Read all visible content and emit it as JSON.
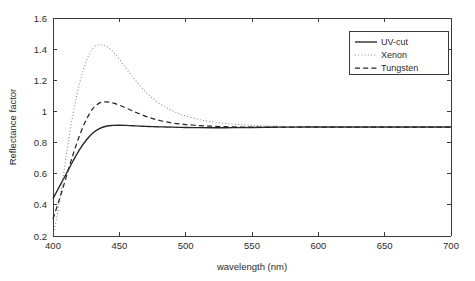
{
  "chart_data": {
    "type": "line",
    "title": "",
    "xlabel": "wavelength (nm)",
    "ylabel": "Reflectance factor",
    "xlim": [
      400,
      700
    ],
    "ylim": [
      0.2,
      1.6
    ],
    "xticks": [
      400,
      450,
      500,
      550,
      600,
      650,
      700
    ],
    "xticklabels": [
      "400",
      "450",
      "500",
      "550",
      "600",
      "650",
      "700"
    ],
    "yticks": [
      0.2,
      0.4,
      0.6,
      0.8,
      1,
      1.2,
      1.4,
      1.6
    ],
    "yticklabels": [
      "0.2",
      "0.4",
      "0.6",
      "0.8",
      "1",
      "1.2",
      "1.4",
      "1.6"
    ],
    "grid": false,
    "legend_position": "upper right",
    "x": [
      400,
      405,
      410,
      415,
      420,
      425,
      430,
      435,
      440,
      445,
      450,
      455,
      460,
      465,
      470,
      475,
      480,
      485,
      490,
      495,
      500,
      510,
      520,
      530,
      540,
      550,
      560,
      570,
      580,
      590,
      600,
      620,
      640,
      660,
      680,
      700
    ],
    "series": [
      {
        "name": "UV-cut",
        "style": "solid",
        "color": "#262626",
        "values": [
          0.44,
          0.52,
          0.6,
          0.68,
          0.755,
          0.815,
          0.862,
          0.89,
          0.905,
          0.91,
          0.911,
          0.91,
          0.908,
          0.906,
          0.904,
          0.902,
          0.901,
          0.9,
          0.899,
          0.898,
          0.897,
          0.896,
          0.895,
          0.895,
          0.896,
          0.897,
          0.898,
          0.899,
          0.899,
          0.9,
          0.9,
          0.9,
          0.9,
          0.9,
          0.9,
          0.9
        ]
      },
      {
        "name": "Xenon",
        "style": "dotted",
        "color": "#8c8c8c",
        "values": [
          0.12,
          0.42,
          0.72,
          0.98,
          1.18,
          1.32,
          1.405,
          1.428,
          1.418,
          1.385,
          1.335,
          1.278,
          1.222,
          1.17,
          1.124,
          1.085,
          1.052,
          1.026,
          1.004,
          0.986,
          0.971,
          0.948,
          0.933,
          0.923,
          0.916,
          0.911,
          0.907,
          0.905,
          0.903,
          0.902,
          0.901,
          0.9,
          0.9,
          0.9,
          0.9,
          0.9
        ]
      },
      {
        "name": "Tungsten",
        "style": "dashed",
        "color": "#262626",
        "values": [
          0.31,
          0.44,
          0.58,
          0.72,
          0.845,
          0.945,
          1.018,
          1.053,
          1.062,
          1.055,
          1.04,
          1.022,
          1.003,
          0.985,
          0.968,
          0.954,
          0.943,
          0.933,
          0.926,
          0.92,
          0.916,
          0.909,
          0.905,
          0.902,
          0.9,
          0.899,
          0.899,
          0.899,
          0.899,
          0.9,
          0.9,
          0.9,
          0.9,
          0.9,
          0.9,
          0.9
        ]
      }
    ],
    "legend": [
      {
        "label": "UV-cut",
        "style": "solid",
        "color": "#262626"
      },
      {
        "label": "Xenon",
        "style": "dotted",
        "color": "#8c8c8c"
      },
      {
        "label": "Tungsten",
        "style": "dashed",
        "color": "#262626"
      }
    ]
  }
}
